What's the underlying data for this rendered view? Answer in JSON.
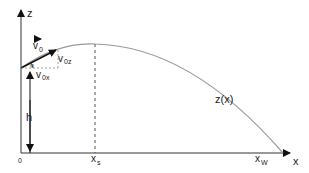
{
  "diagram": {
    "axes": {
      "z_label": "z",
      "x_label": "x",
      "origin_label": "0"
    },
    "labels": {
      "v0": "v",
      "v0_sub": "0",
      "v0z": "v",
      "v0z_sub": "0z",
      "v0x": "v",
      "v0x_sub": "0x",
      "curve": "z(x)",
      "height": "h",
      "xs": "x",
      "xs_sub": "s",
      "xw": "x",
      "xw_sub": "W"
    },
    "colors": {
      "axis": "#222222",
      "curve": "#999999",
      "dashed": "#555555"
    }
  }
}
